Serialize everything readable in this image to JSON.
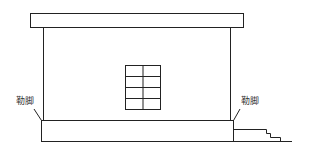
{
  "diagram": {
    "type": "building-elevation",
    "labels": {
      "left_plinth": "勒脚",
      "right_plinth": "勒脚"
    },
    "components": [
      "roof-slab",
      "wall",
      "window",
      "plinth",
      "steps",
      "ground-line"
    ],
    "window": {
      "columns": 2,
      "rows": 4
    },
    "colors": {
      "line": "#222222",
      "background": "#ffffff",
      "text": "#333333"
    }
  }
}
